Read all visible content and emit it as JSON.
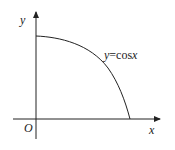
{
  "figure": {
    "y_axis_label": "y",
    "x_axis_label": "x",
    "origin_label": "O",
    "curve_label_var": "y",
    "curve_label_eq": "=cos",
    "curve_label_arg": "x",
    "colors": {
      "stroke": "#222222",
      "background": "#ffffff"
    }
  }
}
